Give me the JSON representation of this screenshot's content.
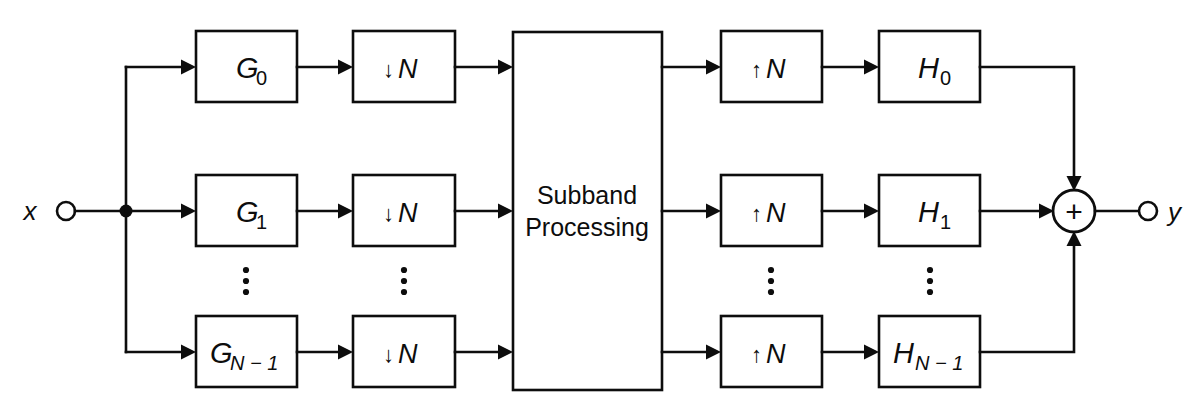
{
  "diagram": {
    "background_color": "#ffffff",
    "line_color": "#0d0d0d"
  },
  "io": {
    "input_label": "x",
    "input_terminal": "open-circle",
    "output_label": "y",
    "output_terminal": "open-circle"
  },
  "summer": {
    "symbol": "+",
    "name": "adder"
  },
  "analysis": {
    "filters": [
      {
        "base": "G",
        "sub": "0",
        "label": "G0"
      },
      {
        "base": "G",
        "sub": "1",
        "label": "G1"
      },
      {
        "base": "G",
        "sub": "N − 1",
        "label": "GN-1"
      }
    ],
    "decimators": [
      {
        "arrow": "↓",
        "factor": "N",
        "label": "↓N"
      },
      {
        "arrow": "↓",
        "factor": "N",
        "label": "↓N"
      },
      {
        "arrow": "↓",
        "factor": "N",
        "label": "↓N"
      }
    ]
  },
  "synthesis": {
    "interpolators": [
      {
        "arrow": "↑",
        "factor": "N",
        "label": "↑N"
      },
      {
        "arrow": "↑",
        "factor": "N",
        "label": "↑N"
      },
      {
        "arrow": "↑",
        "factor": "N",
        "label": "↑N"
      }
    ],
    "filters": [
      {
        "base": "H",
        "sub": "0",
        "label": "H0"
      },
      {
        "base": "H",
        "sub": "1",
        "label": "H1"
      },
      {
        "base": "H",
        "sub": "N − 1",
        "label": "HN-1"
      }
    ]
  },
  "center_block": {
    "line1": "Subband",
    "line2": "Processing"
  },
  "ellipses": {
    "glyph": "vertical-dots",
    "count": 4,
    "columns": [
      "analysis-filter",
      "decimator",
      "interpolator",
      "synthesis-filter"
    ]
  }
}
